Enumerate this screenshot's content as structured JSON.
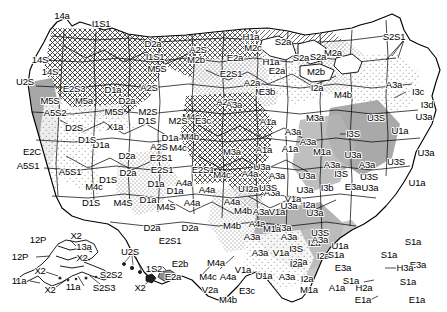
{
  "figure": {
    "name": "us-ecoregion-code-map",
    "kind": "thematic-map",
    "region": "United States (conterminous, Alaska, Hawaii, Puerto Rico insets)",
    "width": 447,
    "height": 312,
    "background_color": "#ffffff",
    "line_color": "#000000"
  },
  "fill_patterns": [
    {
      "id": "white",
      "label": "white",
      "color": "#ffffff"
    },
    {
      "id": "light-stipple",
      "label": "light stipple",
      "color": "#e3e3e3"
    },
    {
      "id": "mid-stipple",
      "label": "medium stipple",
      "color": "#c9c9c9"
    },
    {
      "id": "dense-stipple",
      "label": "dense stipple",
      "color": "#a8a8a8"
    },
    {
      "id": "solid-gray",
      "label": "solid gray",
      "color": "#9a9a9a"
    },
    {
      "id": "cross-hatch",
      "label": "cross hatch",
      "color": "#b5b5b5"
    },
    {
      "id": "diag-hatch",
      "label": "diagonal hatch",
      "color": "#bdbdbd"
    },
    {
      "id": "dark-gray",
      "label": "dark gray",
      "color": "#7d7d7d"
    }
  ],
  "map_data": {
    "type": "choropleth-code-map",
    "title": "",
    "labels": [
      {
        "text": "14a",
        "x": 62,
        "y": 16
      },
      {
        "text": "I1S1",
        "x": 101,
        "y": 24
      },
      {
        "text": "D2a",
        "x": 153,
        "y": 44
      },
      {
        "text": "A2S",
        "x": 198,
        "y": 50
      },
      {
        "text": "M2c",
        "x": 253,
        "y": 48
      },
      {
        "text": "M2a",
        "x": 333,
        "y": 53
      },
      {
        "text": "H1a",
        "x": 251,
        "y": 37
      },
      {
        "text": "S2a",
        "x": 283,
        "y": 42
      },
      {
        "text": "S2S1",
        "x": 394,
        "y": 37
      },
      {
        "text": "14S",
        "x": 40,
        "y": 60
      },
      {
        "text": "I1S1",
        "x": 155,
        "y": 57
      },
      {
        "text": "M2b",
        "x": 196,
        "y": 60
      },
      {
        "text": "E2a",
        "x": 235,
        "y": 58
      },
      {
        "text": "H1a",
        "x": 271,
        "y": 62
      },
      {
        "text": "S2a",
        "x": 301,
        "y": 58
      },
      {
        "text": "14S",
        "x": 50,
        "y": 72
      },
      {
        "text": "M5S",
        "x": 157,
        "y": 69
      },
      {
        "text": "E2S1",
        "x": 231,
        "y": 74
      },
      {
        "text": "E2a",
        "x": 277,
        "y": 71
      },
      {
        "text": "M2b",
        "x": 316,
        "y": 72
      },
      {
        "text": "S2a",
        "x": 318,
        "y": 57
      },
      {
        "text": "U2S",
        "x": 25,
        "y": 82
      },
      {
        "text": "E2S3",
        "x": 74,
        "y": 89
      },
      {
        "text": "D1a",
        "x": 113,
        "y": 90
      },
      {
        "text": "A2S",
        "x": 149,
        "y": 88
      },
      {
        "text": "M2c",
        "x": 264,
        "y": 92
      },
      {
        "text": "E3b",
        "x": 267,
        "y": 92
      },
      {
        "text": "M4b",
        "x": 343,
        "y": 95
      },
      {
        "text": "A3a",
        "x": 394,
        "y": 85
      },
      {
        "text": "I3c",
        "x": 418,
        "y": 92
      },
      {
        "text": "M5S",
        "x": 50,
        "y": 101
      },
      {
        "text": "M5a",
        "x": 84,
        "y": 101
      },
      {
        "text": "D2a",
        "x": 127,
        "y": 101
      },
      {
        "text": "A2S",
        "x": 225,
        "y": 102
      },
      {
        "text": "A2a",
        "x": 252,
        "y": 83
      },
      {
        "text": "I2a",
        "x": 317,
        "y": 88
      },
      {
        "text": "I3d",
        "x": 427,
        "y": 105
      },
      {
        "text": "A5S2",
        "x": 55,
        "y": 113
      },
      {
        "text": "M5S",
        "x": 114,
        "y": 112
      },
      {
        "text": "M2S",
        "x": 148,
        "y": 112
      },
      {
        "text": "M4c",
        "x": 191,
        "y": 117
      },
      {
        "text": "A3a",
        "x": 234,
        "y": 105
      },
      {
        "text": "U3S",
        "x": 376,
        "y": 118
      },
      {
        "text": "U3a",
        "x": 424,
        "y": 117
      },
      {
        "text": "D2S",
        "x": 74,
        "y": 128
      },
      {
        "text": "X1a",
        "x": 115,
        "y": 127
      },
      {
        "text": "D1S",
        "x": 147,
        "y": 121
      },
      {
        "text": "M2S",
        "x": 178,
        "y": 121
      },
      {
        "text": "E3c",
        "x": 203,
        "y": 121
      },
      {
        "text": "A1a",
        "x": 268,
        "y": 122
      },
      {
        "text": "M3a",
        "x": 315,
        "y": 118
      },
      {
        "text": "A3a",
        "x": 293,
        "y": 132
      },
      {
        "text": "I3S",
        "x": 353,
        "y": 134
      },
      {
        "text": "U1a",
        "x": 400,
        "y": 131
      },
      {
        "text": "D1a",
        "x": 101,
        "y": 145
      },
      {
        "text": "D1S",
        "x": 87,
        "y": 140
      },
      {
        "text": "D1a",
        "x": 170,
        "y": 138
      },
      {
        "text": "M4b",
        "x": 190,
        "y": 137
      },
      {
        "text": "M4c",
        "x": 178,
        "y": 148
      },
      {
        "text": "A2S",
        "x": 159,
        "y": 147
      },
      {
        "text": "E2C",
        "x": 32,
        "y": 152
      },
      {
        "text": "A5S1",
        "x": 28,
        "y": 166
      },
      {
        "text": "D2a",
        "x": 127,
        "y": 156
      },
      {
        "text": "E2S1",
        "x": 161,
        "y": 158
      },
      {
        "text": "M3a",
        "x": 232,
        "y": 152
      },
      {
        "text": "A1a",
        "x": 264,
        "y": 150
      },
      {
        "text": "A1a",
        "x": 290,
        "y": 149
      },
      {
        "text": "M1a",
        "x": 322,
        "y": 152
      },
      {
        "text": "A3a",
        "x": 308,
        "y": 142
      },
      {
        "text": "U3a",
        "x": 353,
        "y": 155
      },
      {
        "text": "A3a",
        "x": 332,
        "y": 165
      },
      {
        "text": "A3a",
        "x": 367,
        "y": 165
      },
      {
        "text": "U3S",
        "x": 396,
        "y": 162
      },
      {
        "text": "U3a",
        "x": 426,
        "y": 153
      },
      {
        "text": "A5S1",
        "x": 70,
        "y": 172
      },
      {
        "text": "D2a",
        "x": 128,
        "y": 173
      },
      {
        "text": "E2S1",
        "x": 162,
        "y": 170
      },
      {
        "text": "E2S1",
        "x": 203,
        "y": 170
      },
      {
        "text": "M4c",
        "x": 222,
        "y": 175
      },
      {
        "text": "A4a",
        "x": 250,
        "y": 174
      },
      {
        "text": "U3a",
        "x": 262,
        "y": 167
      },
      {
        "text": "U3S",
        "x": 247,
        "y": 189
      },
      {
        "text": "A3a",
        "x": 277,
        "y": 176
      },
      {
        "text": "U3a",
        "x": 307,
        "y": 176
      },
      {
        "text": "I3S",
        "x": 341,
        "y": 174
      },
      {
        "text": "U1a",
        "x": 417,
        "y": 183
      },
      {
        "text": "M4c",
        "x": 94,
        "y": 187
      },
      {
        "text": "D1S",
        "x": 108,
        "y": 180
      },
      {
        "text": "D1a",
        "x": 156,
        "y": 184
      },
      {
        "text": "A4a",
        "x": 184,
        "y": 183
      },
      {
        "text": "D1a",
        "x": 175,
        "y": 191
      },
      {
        "text": "A4a",
        "x": 207,
        "y": 190
      },
      {
        "text": "V1a",
        "x": 293,
        "y": 199
      },
      {
        "text": "U3a",
        "x": 305,
        "y": 190
      },
      {
        "text": "I3b",
        "x": 327,
        "y": 188
      },
      {
        "text": "E3a",
        "x": 353,
        "y": 187
      },
      {
        "text": "A3a",
        "x": 272,
        "y": 193
      },
      {
        "text": "U3a",
        "x": 370,
        "y": 188
      },
      {
        "text": "D1S",
        "x": 91,
        "y": 203
      },
      {
        "text": "M4S",
        "x": 123,
        "y": 203
      },
      {
        "text": "D1a",
        "x": 148,
        "y": 200
      },
      {
        "text": "M4S",
        "x": 166,
        "y": 207
      },
      {
        "text": "A4a",
        "x": 192,
        "y": 203
      },
      {
        "text": "M4b",
        "x": 243,
        "y": 211
      },
      {
        "text": "A4a",
        "x": 232,
        "y": 202
      },
      {
        "text": "I2a",
        "x": 252,
        "y": 189
      },
      {
        "text": "U3a",
        "x": 289,
        "y": 206
      },
      {
        "text": "U3S",
        "x": 268,
        "y": 188
      },
      {
        "text": "A3a",
        "x": 261,
        "y": 212
      },
      {
        "text": "V1a",
        "x": 277,
        "y": 212
      },
      {
        "text": "I2a",
        "x": 309,
        "y": 205
      },
      {
        "text": "U3a",
        "x": 315,
        "y": 213
      },
      {
        "text": "U3S",
        "x": 369,
        "y": 177
      },
      {
        "text": "12P",
        "x": 38,
        "y": 240
      },
      {
        "text": "X2",
        "x": 76,
        "y": 236
      },
      {
        "text": "13a",
        "x": 84,
        "y": 247
      },
      {
        "text": "12P",
        "x": 20,
        "y": 257
      },
      {
        "text": "X2",
        "x": 82,
        "y": 258
      },
      {
        "text": "U2S",
        "x": 130,
        "y": 252
      },
      {
        "text": "E2S1",
        "x": 170,
        "y": 241
      },
      {
        "text": "D2a",
        "x": 152,
        "y": 228
      },
      {
        "text": "D2a",
        "x": 190,
        "y": 228
      },
      {
        "text": "M4b",
        "x": 232,
        "y": 226
      },
      {
        "text": "A4a",
        "x": 257,
        "y": 224
      },
      {
        "text": "X2",
        "x": 40,
        "y": 271
      },
      {
        "text": "11a",
        "x": 19,
        "y": 281
      },
      {
        "text": "X2",
        "x": 50,
        "y": 290
      },
      {
        "text": "11a",
        "x": 73,
        "y": 287
      },
      {
        "text": "S2S3",
        "x": 104,
        "y": 288
      },
      {
        "text": "S2S2",
        "x": 111,
        "y": 275
      },
      {
        "text": "X2",
        "x": 140,
        "y": 288
      },
      {
        "text": "1S2",
        "x": 154,
        "y": 269
      },
      {
        "text": "E2b",
        "x": 180,
        "y": 264
      },
      {
        "text": "E2a",
        "x": 173,
        "y": 277
      },
      {
        "text": "M4c",
        "x": 208,
        "y": 277
      },
      {
        "text": "V2a",
        "x": 210,
        "y": 290
      },
      {
        "text": "M4b",
        "x": 228,
        "y": 300
      },
      {
        "text": "E3c",
        "x": 247,
        "y": 291
      },
      {
        "text": "V1a",
        "x": 243,
        "y": 270
      },
      {
        "text": "M1a",
        "x": 309,
        "y": 290
      },
      {
        "text": "A1a",
        "x": 337,
        "y": 288
      },
      {
        "text": "H2a",
        "x": 364,
        "y": 288
      },
      {
        "text": "I2a",
        "x": 314,
        "y": 243
      },
      {
        "text": "I2a",
        "x": 323,
        "y": 256
      },
      {
        "text": "S1a",
        "x": 336,
        "y": 255
      },
      {
        "text": "E3a",
        "x": 343,
        "y": 268
      },
      {
        "text": "S1a",
        "x": 351,
        "y": 281
      },
      {
        "text": "E1a",
        "x": 363,
        "y": 300
      },
      {
        "text": "S1a",
        "x": 389,
        "y": 255
      },
      {
        "text": "S1a",
        "x": 413,
        "y": 242
      },
      {
        "text": "E3a",
        "x": 418,
        "y": 265
      },
      {
        "text": "S1a",
        "x": 408,
        "y": 282
      },
      {
        "text": "E1a",
        "x": 417,
        "y": 300
      },
      {
        "text": "H3a",
        "x": 405,
        "y": 268
      },
      {
        "text": "A3a",
        "x": 320,
        "y": 240
      },
      {
        "text": "U3a",
        "x": 283,
        "y": 228
      },
      {
        "text": "M1a",
        "x": 272,
        "y": 229
      },
      {
        "text": "A3a",
        "x": 252,
        "y": 237
      },
      {
        "text": "A3a",
        "x": 289,
        "y": 237
      },
      {
        "text": "U3S",
        "x": 320,
        "y": 233
      },
      {
        "text": "U1a",
        "x": 340,
        "y": 246
      },
      {
        "text": "I3S",
        "x": 296,
        "y": 249
      },
      {
        "text": "A3a",
        "x": 260,
        "y": 253
      },
      {
        "text": "V1a",
        "x": 281,
        "y": 253
      },
      {
        "text": "U3a",
        "x": 299,
        "y": 262
      },
      {
        "text": "M4a",
        "x": 216,
        "y": 263
      },
      {
        "text": "A4a",
        "x": 228,
        "y": 277
      },
      {
        "text": "U1a",
        "x": 264,
        "y": 276
      },
      {
        "text": "A3a",
        "x": 287,
        "y": 277
      },
      {
        "text": "I2a",
        "x": 296,
        "y": 264
      },
      {
        "text": "I2a",
        "x": 307,
        "y": 279
      }
    ]
  }
}
